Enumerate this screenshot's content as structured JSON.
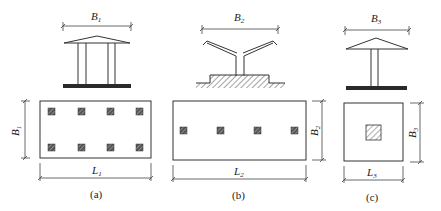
{
  "figure": {
    "panels": [
      {
        "id": "a",
        "caption": "(a)",
        "width_label": "B",
        "width_sub": "1",
        "length_label": "L",
        "length_sub": "1",
        "elevation": "hip-roof canopy on four columns with strip base",
        "plan_columns": 8,
        "plan_layout": "2 rows x 4 columns"
      },
      {
        "id": "b",
        "caption": "(b)",
        "width_label": "B",
        "width_sub": "2",
        "length_label": "L",
        "length_sub": "2",
        "elevation": "Y-shaped (butterfly) canopy on single column with raised hatched base",
        "plan_columns": 4,
        "plan_layout": "1 row x 4 columns"
      },
      {
        "id": "c",
        "caption": "(c)",
        "width_label": "B",
        "width_sub": "3",
        "length_label": "L",
        "length_sub": "3",
        "elevation": "umbrella canopy on single column with strip base",
        "plan_columns": 1,
        "plan_layout": "single central column"
      }
    ]
  },
  "colors": {
    "line": "#333333",
    "fill_dark": "#2a2a2a",
    "background": "#ffffff"
  }
}
